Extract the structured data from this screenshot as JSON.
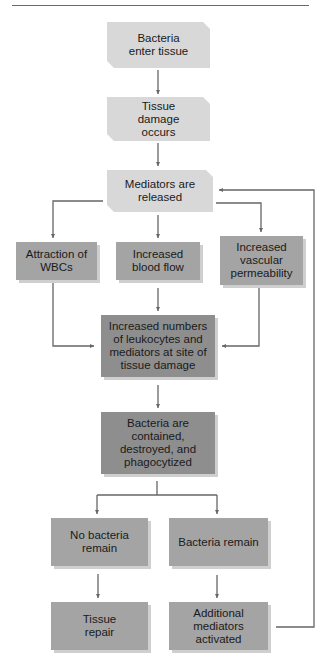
{
  "diagram": {
    "type": "flowchart",
    "colors": {
      "light_box": "#d8d8d8",
      "mid_box": "#a4a4a4",
      "dark_box": "#8e8e8e",
      "connector": "#666666"
    },
    "nodes": {
      "bacteria_enter": "Bacteria enter tissue",
      "tissue_damage": "Tissue damage occurs",
      "mediators_released": "Mediators are released",
      "attraction_wbcs": "Attraction of WBCs",
      "increased_blood_flow": "Increased blood flow",
      "increased_permeability": "Increased vascular permeability",
      "increased_leukocytes": "Increased numbers of leukocytes and mediators at site of tissue damage",
      "bacteria_contained": "Bacteria are contained, destroyed, and phagocytized",
      "no_bacteria_remain": "No bacteria remain",
      "bacteria_remain": "Bacteria remain",
      "tissue_repair": "Tissue repair",
      "additional_mediators": "Additional mediators activated"
    },
    "edges": [
      [
        "bacteria_enter",
        "tissue_damage"
      ],
      [
        "tissue_damage",
        "mediators_released"
      ],
      [
        "mediators_released",
        "attraction_wbcs"
      ],
      [
        "mediators_released",
        "increased_blood_flow"
      ],
      [
        "mediators_released",
        "increased_permeability"
      ],
      [
        "attraction_wbcs",
        "increased_leukocytes"
      ],
      [
        "increased_blood_flow",
        "increased_leukocytes"
      ],
      [
        "increased_permeability",
        "increased_leukocytes"
      ],
      [
        "increased_leukocytes",
        "bacteria_contained"
      ],
      [
        "bacteria_contained",
        "no_bacteria_remain"
      ],
      [
        "bacteria_contained",
        "bacteria_remain"
      ],
      [
        "no_bacteria_remain",
        "tissue_repair"
      ],
      [
        "bacteria_remain",
        "additional_mediators"
      ],
      [
        "additional_mediators",
        "mediators_released"
      ]
    ]
  }
}
